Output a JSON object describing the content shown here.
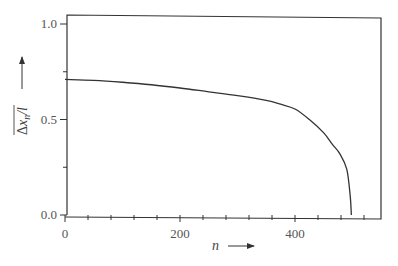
{
  "chart_data": {
    "type": "line",
    "title": "",
    "xlabel": "n",
    "ylabel": "Δx_n/l (overlined)",
    "xlim": [
      0,
      550
    ],
    "ylim": [
      0.0,
      1.0
    ],
    "x_ticks": [
      0,
      200,
      400
    ],
    "x_tick_labels": [
      "0",
      "200",
      "400"
    ],
    "x_minor_tick_step": 40,
    "y_ticks": [
      0.0,
      0.5,
      1.0
    ],
    "y_tick_labels": [
      "0.0",
      "0.5",
      "1.0"
    ],
    "y_minor_ticks": [
      0.25,
      0.75
    ],
    "grid": false,
    "legend": null,
    "series": [
      {
        "name": "Δx_n/l",
        "x": [
          0,
          50,
          100,
          150,
          200,
          250,
          300,
          350,
          375,
          400,
          425,
          450,
          465,
          478,
          490,
          496,
          498
        ],
        "y": [
          0.71,
          0.705,
          0.695,
          0.682,
          0.665,
          0.645,
          0.625,
          0.6,
          0.58,
          0.555,
          0.5,
          0.43,
          0.37,
          0.32,
          0.24,
          0.1,
          0.0
        ]
      }
    ]
  },
  "axes": {
    "x_label_main": "n",
    "y_label_delta": "Δ",
    "y_label_x": "x",
    "y_label_sub": "n",
    "y_label_tail": "/l"
  },
  "colors": {
    "line": "#333333",
    "frame": "#333333",
    "text": "#555555",
    "background": "#ffffff"
  }
}
